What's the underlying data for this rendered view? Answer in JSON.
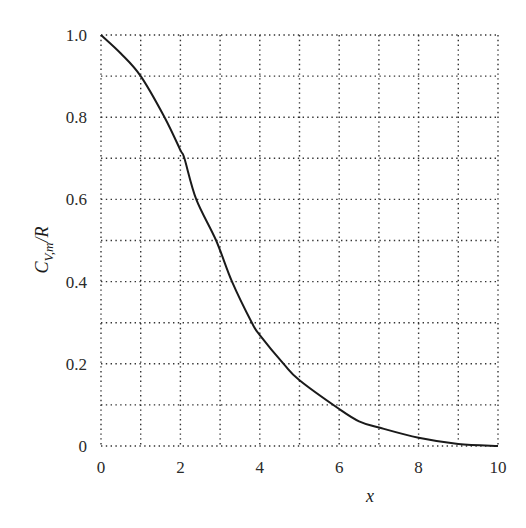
{
  "chart_data": {
    "type": "line",
    "title": "",
    "xlabel": "x",
    "ylabel": "C_V,m/R",
    "ylabel_parts": {
      "main": "C",
      "sub": "V,m",
      "rest": "/R"
    },
    "xlim": [
      0,
      10
    ],
    "ylim": [
      0,
      1.0
    ],
    "grid": true,
    "grid_style": "dotted",
    "x_ticks": [
      0,
      2,
      4,
      6,
      8,
      10
    ],
    "x_tick_labels": [
      "0",
      "2",
      "4",
      "6",
      "8",
      "10"
    ],
    "y_ticks": [
      0,
      0.2,
      0.4,
      0.6,
      0.8,
      1.0
    ],
    "y_tick_labels": [
      "0",
      "0.2",
      "0.4",
      "0.6",
      "0.8",
      "1.0"
    ],
    "x_grid": [
      0,
      1,
      2,
      3,
      4,
      5,
      6,
      7,
      8,
      9,
      10
    ],
    "y_grid": [
      0,
      0.1,
      0.2,
      0.3,
      0.4,
      0.5,
      0.6,
      0.7,
      0.8,
      0.9,
      1.0
    ],
    "series": [
      {
        "name": "C_V,m/R",
        "x": [
          0,
          0.5,
          1.0,
          1.6,
          2.0,
          2.1,
          2.4,
          2.9,
          3.3,
          3.8,
          4.0,
          4.6,
          5.0,
          6.0,
          6.5,
          7.0,
          8.0,
          9.0,
          10.0
        ],
        "y": [
          1.0,
          0.955,
          0.9,
          0.8,
          0.72,
          0.7,
          0.6,
          0.5,
          0.4,
          0.3,
          0.27,
          0.2,
          0.16,
          0.09,
          0.06,
          0.045,
          0.02,
          0.005,
          0.0
        ]
      }
    ]
  },
  "layout": {
    "plot_left": 101,
    "plot_right": 498,
    "plot_top": 35,
    "plot_bottom": 446
  }
}
